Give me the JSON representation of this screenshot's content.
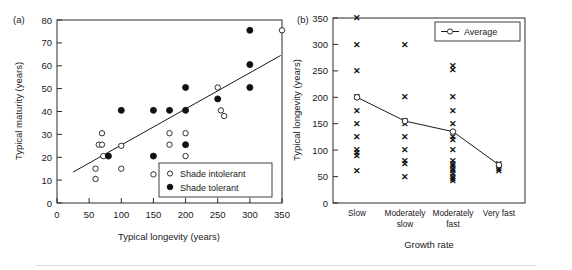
{
  "figure": {
    "background": "#ffffff",
    "foreground": "#1a1a1a",
    "panels": [
      "a",
      "b"
    ]
  },
  "panel_a": {
    "label": "(a)",
    "xlabel": "Typical longevity (years)",
    "ylabel": "Typical maturity (years)",
    "legend": {
      "items": [
        {
          "label": "Shade intolerant",
          "marker": "open-circle"
        },
        {
          "label": "Shade tolerant",
          "marker": "filled-circle"
        }
      ]
    }
  },
  "panel_b": {
    "label": "(b)",
    "xlabel": "Growth rate",
    "ylabel": "Typical longevity (years)",
    "legend": {
      "items": [
        {
          "label": "Average",
          "marker": "line-open-circle"
        }
      ]
    }
  },
  "chart_data": [
    {
      "type": "scatter",
      "panel": "a",
      "title": "",
      "xlabel": "Typical longevity (years)",
      "ylabel": "Typical maturity (years)",
      "xlim": [
        0,
        350
      ],
      "ylim": [
        0,
        80
      ],
      "xticks": [
        0,
        50,
        100,
        150,
        200,
        250,
        300,
        350
      ],
      "yticks": [
        0,
        10,
        20,
        30,
        40,
        50,
        60,
        70,
        80
      ],
      "grid": false,
      "legend_position": "lower-right",
      "series": [
        {
          "name": "Shade intolerant",
          "marker": "open-circle",
          "points": [
            [
              60,
              15
            ],
            [
              60,
              10.5
            ],
            [
              65,
              25.5
            ],
            [
              70,
              30.5
            ],
            [
              70,
              25.5
            ],
            [
              72,
              20.5
            ],
            [
              100,
              25
            ],
            [
              100,
              15
            ],
            [
              150,
              12.5
            ],
            [
              175,
              30.5
            ],
            [
              175,
              25.5
            ],
            [
              200,
              30.5
            ],
            [
              200,
              20.5
            ],
            [
              250,
              50.5
            ],
            [
              255,
              40.5
            ],
            [
              260,
              38
            ],
            [
              350,
              75.5
            ]
          ]
        },
        {
          "name": "Shade tolerant",
          "marker": "filled-circle",
          "points": [
            [
              80,
              20.5
            ],
            [
              100,
              40.5
            ],
            [
              150,
              40.5
            ],
            [
              150,
              20.5
            ],
            [
              175,
              40.5
            ],
            [
              200,
              40.5
            ],
            [
              200,
              50.5
            ],
            [
              200,
              25.5
            ],
            [
              250,
              45.5
            ],
            [
              300,
              75.5
            ],
            [
              300,
              60.5
            ],
            [
              300,
              50.5
            ]
          ]
        }
      ],
      "trendline": {
        "x": [
          25,
          348
        ],
        "y": [
          13.5,
          64.5
        ]
      }
    },
    {
      "type": "scatter",
      "panel": "b",
      "title": "",
      "xlabel": "Growth rate",
      "ylabel": "Typical longevity (years)",
      "categories": [
        "Slow",
        "Moderately slow",
        "Moderately fast",
        "Very fast"
      ],
      "ylim": [
        0,
        350
      ],
      "yticks": [
        0,
        50,
        100,
        150,
        200,
        250,
        300,
        350
      ],
      "grid": false,
      "legend_position": "upper-right",
      "groups": [
        {
          "category": "Slow",
          "values": [
            350,
            300,
            250,
            200,
            175,
            150,
            125,
            100,
            95,
            90,
            60
          ]
        },
        {
          "category": "Moderately slow",
          "values": [
            300,
            200,
            155,
            150,
            125,
            100,
            80,
            75,
            50
          ]
        },
        {
          "category": "Moderately fast",
          "values": [
            260,
            252,
            200,
            175,
            150,
            125,
            120,
            100,
            80,
            75,
            70,
            65,
            60,
            55,
            50,
            45,
            42
          ]
        },
        {
          "category": "Very fast",
          "values": [
            75,
            70,
            65,
            60
          ]
        }
      ],
      "average_series": {
        "name": "Average",
        "categories": [
          "Slow",
          "Moderately slow",
          "Moderately fast",
          "Very fast"
        ],
        "values": [
          200,
          155,
          135,
          72
        ]
      }
    }
  ]
}
